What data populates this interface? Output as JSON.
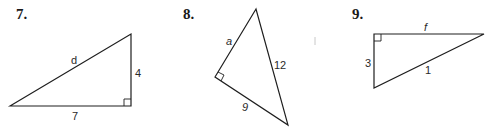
{
  "problems": [
    {
      "number": "7.",
      "labels": {
        "hypotenuse": "d",
        "vertical_leg": "4",
        "horizontal_leg": "7"
      },
      "right_angle_position": "bottom-right"
    },
    {
      "number": "8.",
      "labels": {
        "upper_leg": "a",
        "hypotenuse": "12",
        "lower_leg": "9"
      },
      "right_angle_position": "left"
    },
    {
      "number": "9.",
      "labels": {
        "top_leg": "f",
        "vertical_leg": "3",
        "hypotenuse": "1"
      },
      "right_angle_position": "top-left"
    }
  ]
}
